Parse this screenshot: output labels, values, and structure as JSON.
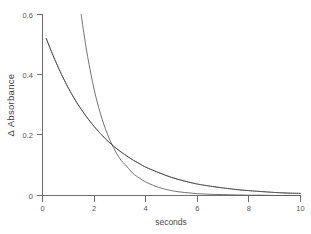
{
  "chart_data": {
    "type": "line",
    "title": "",
    "xlabel": "seconds",
    "ylabel": "Δ Absorbance",
    "xlim": [
      0,
      10
    ],
    "ylim": [
      0,
      0.6
    ],
    "grid": false,
    "legend": null,
    "x_ticks": [
      "0",
      "2",
      "4",
      "6",
      "8",
      "10"
    ],
    "x_tick_values": [
      0,
      2,
      4,
      6,
      8,
      10
    ],
    "y_ticks": [
      "0",
      "0.2",
      "0.4",
      "0.6"
    ],
    "y_tick_values": [
      0,
      0.2,
      0.4,
      0.6
    ],
    "series": [
      {
        "name": "slow decay trace",
        "style": "dotted-over-line",
        "color": "#2e2e2e",
        "x": [
          0.15,
          0.3,
          0.5,
          0.75,
          1.0,
          1.25,
          1.5,
          1.75,
          2.0,
          2.25,
          2.5,
          2.75,
          3.0,
          3.2,
          3.5,
          3.75,
          4.0,
          4.5,
          5.0,
          5.5,
          6.0,
          6.5,
          7.0,
          7.5,
          8.0,
          8.5,
          9.0,
          9.5,
          10.0
        ],
        "y": [
          0.52,
          0.487,
          0.446,
          0.399,
          0.357,
          0.319,
          0.286,
          0.256,
          0.229,
          0.205,
          0.183,
          0.164,
          0.147,
          0.135,
          0.118,
          0.106,
          0.094,
          0.076,
          0.06,
          0.048,
          0.038,
          0.031,
          0.025,
          0.02,
          0.016,
          0.013,
          0.01,
          0.008,
          0.007
        ]
      },
      {
        "name": "fast decay fit",
        "style": "solid",
        "color": "#5a5a5a",
        "x": [
          1.5,
          1.6,
          1.75,
          2.0,
          2.25,
          2.5,
          2.75,
          3.0,
          3.2,
          3.5,
          3.75,
          4.0,
          4.25,
          4.5,
          5.0,
          5.5,
          6.0,
          6.5,
          7.0,
          7.5,
          8.0,
          8.5,
          9.0,
          9.5,
          10.0
        ],
        "y": [
          0.6,
          0.54,
          0.46,
          0.352,
          0.27,
          0.207,
          0.159,
          0.122,
          0.103,
          0.074,
          0.058,
          0.045,
          0.035,
          0.027,
          0.016,
          0.01,
          0.006,
          0.004,
          0.003,
          0.002,
          0.001,
          0.001,
          0.0,
          0.0,
          0.0
        ]
      }
    ],
    "crossover": {
      "x": 3.2,
      "y": 0.05
    }
  },
  "axes": {
    "y_axis_title": "Δ Absorbance",
    "x_axis_title": "seconds"
  }
}
